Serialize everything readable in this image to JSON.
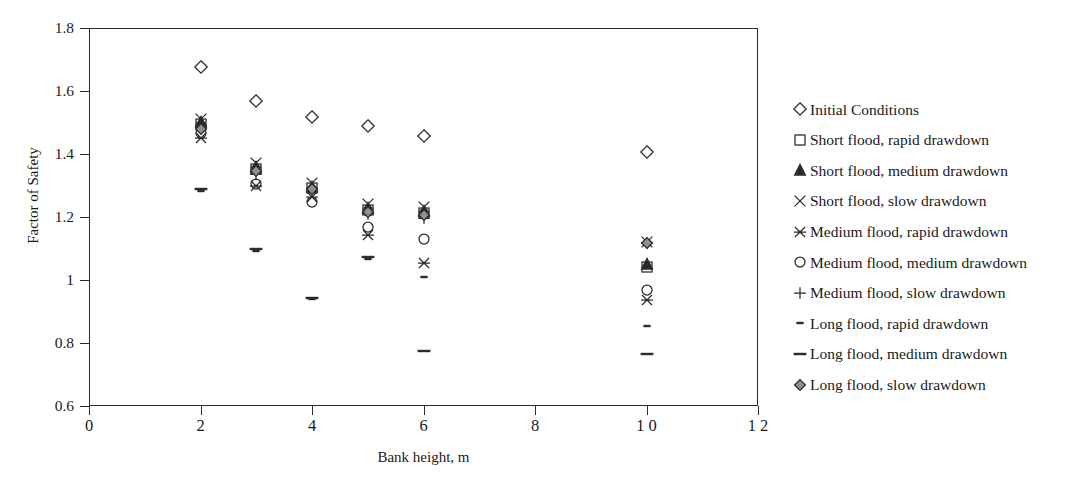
{
  "figure": {
    "clipped_header": "",
    "background": "#ffffff",
    "marker_color": "#2a2a2a",
    "axis_color": "#2a2a2a"
  },
  "chart_data": {
    "type": "scatter",
    "title": "",
    "xlabel": "Bank height, m",
    "ylabel": "Factor of Safety",
    "xlim": [
      0,
      12
    ],
    "ylim": [
      0.6,
      1.8
    ],
    "xticks": [
      0,
      2,
      4,
      6,
      8,
      10,
      12
    ],
    "xtick_labels": [
      "0",
      "2",
      "4",
      "6",
      "8",
      "1 0",
      "1 2"
    ],
    "yticks": [
      0.6,
      0.8,
      1.0,
      1.2,
      1.4,
      1.6,
      1.8
    ],
    "ytick_labels": [
      "0.6",
      "0.8",
      "1",
      "1.2",
      "1.4",
      "1.6",
      "1.8"
    ],
    "grid": false,
    "legend_position": "right",
    "x": [
      2,
      3,
      4,
      5,
      6,
      10
    ],
    "series": [
      {
        "name": "Initial Conditions",
        "marker": "open-diamond",
        "values": [
          1.675,
          1.568,
          1.518,
          1.489,
          1.458,
          1.405
        ]
      },
      {
        "name": "Short flood, rapid drawdown",
        "marker": "open-square",
        "values": [
          1.495,
          1.352,
          1.292,
          1.222,
          1.212,
          1.042
        ]
      },
      {
        "name": "Short flood, medium drawdown",
        "marker": "filled-triangle",
        "values": [
          1.502,
          1.358,
          1.296,
          1.228,
          1.218,
          1.052
        ]
      },
      {
        "name": "Short flood, slow drawdown",
        "marker": "x-cross",
        "values": [
          1.512,
          1.372,
          1.308,
          1.242,
          1.232,
          1.122
        ]
      },
      {
        "name": "Medium flood, rapid drawdown",
        "marker": "asterisk",
        "values": [
          1.452,
          1.298,
          1.262,
          1.142,
          1.055,
          0.938
        ]
      },
      {
        "name": "Medium flood, medium drawdown",
        "marker": "open-circle",
        "values": [
          1.468,
          1.305,
          1.248,
          1.168,
          1.13,
          0.968
        ]
      },
      {
        "name": "Medium flood, slow drawdown",
        "marker": "plus",
        "values": [
          1.488,
          1.338,
          1.282,
          1.208,
          1.198,
          1.118
        ]
      },
      {
        "name": "Long flood, rapid drawdown",
        "marker": "short-dash",
        "values": [
          1.282,
          1.092,
          0.94,
          1.068,
          1.008,
          0.855
        ]
      },
      {
        "name": "Long flood, medium drawdown",
        "marker": "long-dash",
        "values": [
          1.288,
          1.098,
          0.942,
          1.072,
          0.776,
          0.765
        ]
      },
      {
        "name": "Long flood, slow drawdown",
        "marker": "filled-diamond",
        "values": [
          1.478,
          1.345,
          1.288,
          1.215,
          1.205,
          1.118
        ]
      }
    ]
  },
  "legend": {
    "entries": [
      {
        "label": "Initial Conditions",
        "marker": "open-diamond"
      },
      {
        "label": "Short flood, rapid drawdown",
        "marker": "open-square"
      },
      {
        "label": "Short flood, medium drawdown",
        "marker": "filled-triangle"
      },
      {
        "label": "Short flood, slow drawdown",
        "marker": "x-cross"
      },
      {
        "label": "Medium flood, rapid drawdown",
        "marker": "asterisk"
      },
      {
        "label": "Medium flood, medium drawdown",
        "marker": "open-circle"
      },
      {
        "label": "Medium flood, slow drawdown",
        "marker": "plus"
      },
      {
        "label": "Long flood, rapid drawdown",
        "marker": "short-dash"
      },
      {
        "label": "Long flood, medium drawdown",
        "marker": "long-dash"
      },
      {
        "label": "Long flood, slow drawdown",
        "marker": "filled-diamond"
      }
    ]
  }
}
